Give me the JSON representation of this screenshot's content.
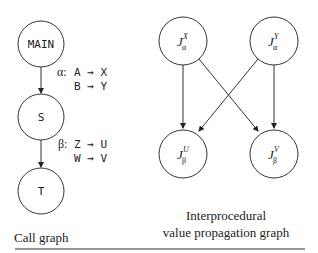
{
  "call_graph": {
    "caption": "Call graph",
    "nodes": [
      {
        "id": "main",
        "label": "MAIN"
      },
      {
        "id": "s",
        "label": "S"
      },
      {
        "id": "t",
        "label": "T"
      }
    ],
    "edges": [
      {
        "from": "MAIN",
        "to": "S",
        "name": "α:",
        "mappings": [
          "A → X",
          "B → Y"
        ]
      },
      {
        "from": "S",
        "to": "T",
        "name": "β:",
        "mappings": [
          "Z → U",
          "W → V"
        ]
      }
    ]
  },
  "value_graph": {
    "caption_line1": "Interprocedural",
    "caption_line2": "value propagation graph",
    "nodes": [
      {
        "id": "jax",
        "base": "J",
        "sup": "X",
        "sub": "α"
      },
      {
        "id": "jay",
        "base": "J",
        "sup": "Y",
        "sub": "α"
      },
      {
        "id": "jbu",
        "base": "J",
        "sup": "U",
        "sub": "β"
      },
      {
        "id": "jbv",
        "base": "J",
        "sup": "V",
        "sub": "β"
      }
    ],
    "edges": [
      {
        "from": "J_α^X",
        "to": "J_β^U"
      },
      {
        "from": "J_α^X",
        "to": "J_β^V"
      },
      {
        "from": "J_α^Y",
        "to": "J_β^U"
      },
      {
        "from": "J_α^Y",
        "to": "J_β^V"
      }
    ]
  }
}
